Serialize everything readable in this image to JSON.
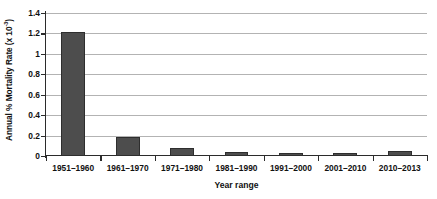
{
  "chart_data": {
    "type": "bar",
    "title": "",
    "xlabel": "Year range",
    "ylabel": "Annual % Mortality Rate (x 10-3)",
    "ylabel_prefix": "Annual % Mortality Rate (x 10",
    "ylabel_exponent": "-3",
    "ylabel_suffix": ")",
    "categories": [
      "1951–1960",
      "1961–1970",
      "1971–1980",
      "1981–1990",
      "1991–2000",
      "2001–2010",
      "2010–2013"
    ],
    "values": [
      1.21,
      0.185,
      0.08,
      0.042,
      0.032,
      0.032,
      0.046
    ],
    "ylim": [
      0,
      1.4
    ],
    "ytick_labels": [
      "0",
      "0.2",
      "0.4",
      "0.6",
      "0.8",
      "1",
      "1.2",
      "1.4"
    ],
    "ytick_values": [
      0,
      0.2,
      0.4,
      0.6,
      0.8,
      1,
      1.2,
      1.4
    ],
    "grid": true,
    "legend": false,
    "bar_color": "#4d4d4d",
    "bar_edge_color": "#2e2e2e",
    "grid_color": "#b3b3b3",
    "axis_color": "#2b2b2b"
  }
}
